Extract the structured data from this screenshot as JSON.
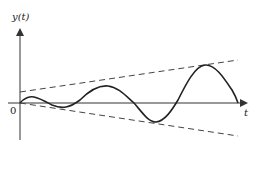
{
  "diagram": {
    "type": "growing-oscillation",
    "y_axis_label": "y(t)",
    "x_axis_label": "t",
    "origin_label": "0",
    "colors": {
      "axis": "#333333",
      "curve": "#222222",
      "envelope": "#444444",
      "background": "#ffffff"
    }
  }
}
